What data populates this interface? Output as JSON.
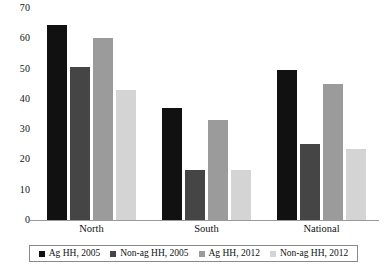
{
  "chart_data": {
    "type": "bar",
    "title": "",
    "subtitle": "",
    "xlabel": "",
    "ylabel": "",
    "categories": [
      "North",
      "South",
      "National"
    ],
    "ylim": [
      0,
      70
    ],
    "yticks": [
      70,
      60,
      50,
      40,
      30,
      20,
      10,
      0
    ],
    "ytick_labels": [
      "70",
      "60",
      "50",
      "40",
      "30",
      "20",
      "10",
      "0"
    ],
    "grid": false,
    "legend_position": "bottom",
    "series": [
      {
        "name": "Ag HH, 2005",
        "color": "#111111",
        "values": [
          64.5,
          37.0,
          49.5
        ]
      },
      {
        "name": "Non-ag HH, 2005",
        "color": "#454545",
        "values": [
          50.5,
          16.5,
          25.0
        ]
      },
      {
        "name": "Ag HH, 2012",
        "color": "#9b9b9b",
        "values": [
          60.0,
          33.0,
          45.0
        ]
      },
      {
        "name": "Non-ag HH, 2012",
        "color": "#d4d4d4",
        "values": [
          43.0,
          16.5,
          23.5
        ]
      }
    ]
  },
  "axis": {
    "y_ticks": [
      "70",
      "60",
      "50",
      "40",
      "30",
      "20",
      "10",
      "0"
    ],
    "categories": [
      "North",
      "South",
      "National"
    ]
  },
  "legend": {
    "items": [
      {
        "label": "Ag HH, 2005",
        "color": "#111111"
      },
      {
        "label": "Non-ag HH, 2005",
        "color": "#454545"
      },
      {
        "label": "Ag HH, 2012",
        "color": "#9b9b9b"
      },
      {
        "label": "Non-ag HH, 2012",
        "color": "#d4d4d4"
      }
    ]
  }
}
